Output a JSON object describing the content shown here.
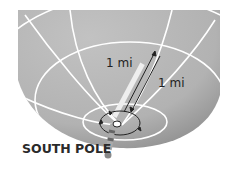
{
  "diagram": {
    "labels": {
      "distance_a": "1 mi",
      "distance_b": "1 mi",
      "pole": "SOUTH POLE"
    },
    "colors": {
      "globe": "#b4b4b4",
      "globe_shadow": "#9a9a9a",
      "gridlines": "#ffffff",
      "arrows": "#222222",
      "text": "#222222"
    },
    "icons": [
      "globe-shape",
      "path-arrow-icon",
      "circular-arrow-icon",
      "pole-post-icon"
    ]
  }
}
